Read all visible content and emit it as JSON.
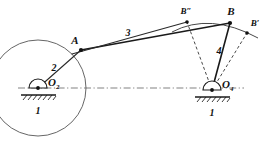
{
  "labels": {
    "point_a": "A",
    "point_b": "B",
    "point_b_prime": "B′",
    "point_b_double_prime": "B″",
    "pivot_o2_letter": "O",
    "pivot_o2_sub": "2",
    "pivot_o4_letter": "O",
    "pivot_o4_sub": "4",
    "link_2": "2",
    "link_3": "3",
    "link_4": "4",
    "ground_left": "1",
    "ground_right": "1"
  },
  "geometry": {
    "point_a": {
      "x": 81,
      "y": 50
    },
    "point_b": {
      "x": 230,
      "y": 23
    },
    "point_b_prime": {
      "x": 247,
      "y": 33
    },
    "point_b_double_prime": {
      "x": 187,
      "y": 22
    },
    "pivot_o2": {
      "x": 38,
      "y": 88
    },
    "pivot_o4": {
      "x": 212,
      "y": 90
    },
    "crank_circle_radius": 48,
    "centerline_y": 88,
    "centerline_x_start": 18,
    "centerline_x_end": 244
  },
  "colors": {
    "background": "#ffffff",
    "link_stroke": "#1a1a1a",
    "construction_stroke": "#555555",
    "centerline_stroke": "#6b6b6b",
    "label_fill": "#111111"
  }
}
